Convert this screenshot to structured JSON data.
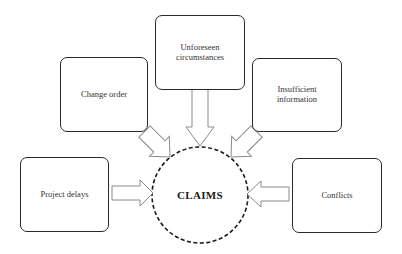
{
  "diagram": {
    "center": {
      "label": "CLAIMS",
      "shape": "dashed-circle",
      "cx": 200,
      "cy": 195,
      "r": 48
    },
    "nodes": [
      {
        "id": "change-order",
        "label": "Change order",
        "x": 60,
        "y": 57,
        "w": 88,
        "h": 75
      },
      {
        "id": "unforeseen-circumstances",
        "label": "Unforeseen circumstances",
        "label_lines": [
          "Unforeseen",
          "circumstances"
        ],
        "x": 155,
        "y": 15,
        "w": 90,
        "h": 75
      },
      {
        "id": "insufficient-information",
        "label": "Insufficient information",
        "x": 252,
        "y": 58,
        "w": 90,
        "h": 74
      },
      {
        "id": "project-delays",
        "label": "Project delays",
        "x": 20,
        "y": 157,
        "w": 89,
        "h": 75
      },
      {
        "id": "conflicts",
        "label": "Conflicts",
        "x": 292,
        "y": 158,
        "w": 90,
        "h": 75
      }
    ],
    "edges": [
      {
        "from": "change-order",
        "to": "center",
        "style": "hollow-block-arrow"
      },
      {
        "from": "unforeseen-circumstances",
        "to": "center",
        "style": "hollow-block-arrow"
      },
      {
        "from": "insufficient-information",
        "to": "center",
        "style": "hollow-block-arrow"
      },
      {
        "from": "project-delays",
        "to": "center",
        "style": "hollow-block-arrow"
      },
      {
        "from": "conflicts",
        "to": "center",
        "style": "hollow-block-arrow"
      }
    ],
    "colors": {
      "box_border": "#2a2a2a",
      "arrow_stroke": "#8a8a8a",
      "circle_stroke": "#1a1a1a",
      "text": "#333333",
      "background": "#ffffff"
    }
  }
}
